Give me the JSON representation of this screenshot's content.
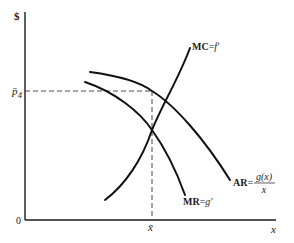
{
  "diagram": {
    "type": "economics-monopoly-pricing",
    "y_axis": {
      "label": "$",
      "tick_label": "p̄",
      "tick_subscript": "4",
      "origin_label": "0"
    },
    "x_axis": {
      "label": "x",
      "tick_label": "x̄"
    },
    "curves": [
      {
        "id": "mc",
        "label": "MC",
        "equals": "=",
        "expr": "f′"
      },
      {
        "id": "mr",
        "label": "MR",
        "equals": "=",
        "expr": "g′"
      },
      {
        "id": "ar",
        "label": "AR",
        "equals": "=",
        "numerator": "g(x)",
        "denominator": "x"
      }
    ],
    "guides": [
      {
        "id": "price-line",
        "from": "p̄4 on y-axis",
        "to": "AR at x̄"
      },
      {
        "id": "quantity-line",
        "from": "x̄ on x-axis",
        "to": "AR at x̄"
      }
    ],
    "colors": {
      "ink": "#111111",
      "background": "#ffffff"
    }
  }
}
